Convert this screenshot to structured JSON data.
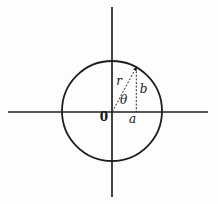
{
  "figure": {
    "background_color": "#fdfdfd",
    "ink_color": "#222222",
    "labels": {
      "origin": "0",
      "radius": "r",
      "angle": "θ",
      "horizontal_leg": "a",
      "vertical_leg": "b"
    },
    "geometry": {
      "origin_px": {
        "x": 112,
        "y": 112
      },
      "circle_center_px": {
        "x": 112,
        "y": 111
      },
      "circle_radius_px": 50,
      "terminal_point_px": {
        "x": 136,
        "y": 68
      },
      "angle_from_x_axis_deg": 61,
      "line_styles": {
        "axes": "solid",
        "circle": "solid",
        "radius": "dotted-with-arrowhead",
        "ordinate": "dotted"
      }
    }
  }
}
